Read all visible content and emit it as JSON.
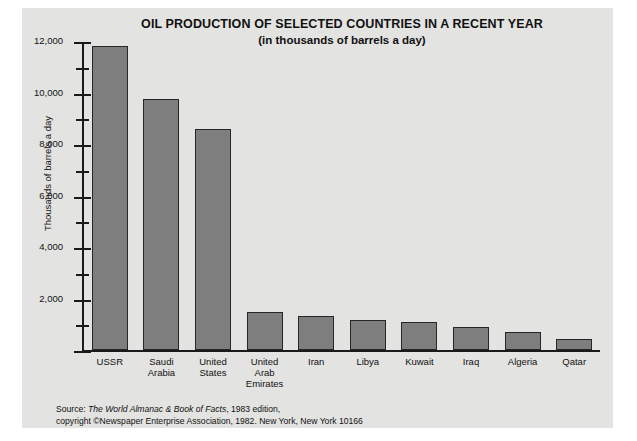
{
  "chart_data": {
    "type": "bar",
    "title": "OIL PRODUCTION OF SELECTED COUNTRIES IN A RECENT YEAR",
    "subtitle": "(in thousands of barrels a day)",
    "xlabel": "",
    "ylabel": "Thousands of barrels a day",
    "ylim": [
      0,
      12000
    ],
    "grid": false,
    "legend": false,
    "y_major_ticks": [
      0,
      2000,
      4000,
      6000,
      8000,
      10000,
      12000
    ],
    "y_minor_ticks": [
      1000,
      3000,
      5000,
      7000,
      9000,
      11000
    ],
    "y_tick_labels": [
      "2,000",
      "4,000",
      "6,000",
      "8,000",
      "10,000",
      "12,000"
    ],
    "categories": [
      "USSR",
      "Saudi Arabia",
      "United States",
      "United Arab Emirates",
      "Iran",
      "Libya",
      "Kuwait",
      "Iraq",
      "Algeria",
      "Qatar"
    ],
    "category_label_lines": [
      [
        "USSR"
      ],
      [
        "Saudi",
        "Arabia"
      ],
      [
        "United",
        "States"
      ],
      [
        "United",
        "Arab",
        "Emirates"
      ],
      [
        "Iran"
      ],
      [
        "Libya"
      ],
      [
        "Kuwait"
      ],
      [
        "Iraq"
      ],
      [
        "Algeria"
      ],
      [
        "Qatar"
      ]
    ],
    "values": [
      11800,
      9750,
      8600,
      1470,
      1320,
      1150,
      1100,
      900,
      700,
      440
    ],
    "bar_color": "#7e7e7e",
    "bar_border_color": "#262626"
  },
  "source": {
    "prefix": "Source: ",
    "publication": "The World Almanac & Book of Facts",
    "edition": ", 1983 edition,",
    "line2_prefix": "copyright ",
    "symbol": "©",
    "line2_rest": "Newspaper Enterprise Association, 1982. New York, New York 10166"
  },
  "colors": {
    "card_background": "#e3e3e1",
    "page_background": "#ffffff",
    "axis": "#1a1a1a",
    "text": "#111111"
  }
}
